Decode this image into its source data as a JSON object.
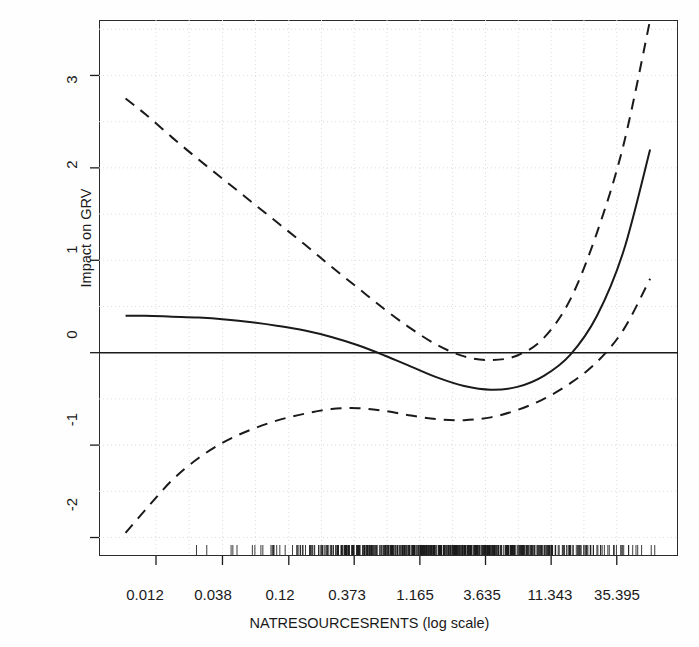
{
  "figure": {
    "kind": "statistical-plot",
    "background_color": "#ffffff",
    "ink_color": "#1a1a1a",
    "grid_color": "#d8d8d8"
  },
  "axes": {
    "x_title": "NATRESOURCESRENTS (log scale)",
    "y_title": "Impact on GRV",
    "x_tick_labels": [
      "0.012",
      "0.038",
      "0.12",
      "0.373",
      "1.165",
      "3.635",
      "11.343",
      "35.395"
    ],
    "y_tick_labels": [
      "3",
      "2",
      "1",
      "0",
      "-1",
      "-2"
    ]
  },
  "chart_data": {
    "type": "line",
    "title": "",
    "subtitle": "",
    "xlabel": "NATRESOURCESRENTS (log scale)",
    "ylabel": "Impact on GRV",
    "x_scale": "log",
    "x_tick_values": [
      0.012,
      0.038,
      0.12,
      0.373,
      1.165,
      3.635,
      11.343,
      35.395
    ],
    "x_tick_labels": [
      "0.012",
      "0.038",
      "0.12",
      "0.373",
      "1.165",
      "3.635",
      "11.343",
      "35.395"
    ],
    "y_tick_values": [
      -2,
      -1,
      0,
      1,
      2,
      3
    ],
    "y_tick_labels": [
      "-2",
      "-1",
      "0",
      "1",
      "2",
      "3"
    ],
    "xlim_log10": [
      -2.35,
      2.01
    ],
    "ylim": [
      -2.2,
      3.6
    ],
    "grid": true,
    "grid_style": "dotted",
    "legend": "none",
    "reference_line": {
      "name": "zero-line",
      "y": 0,
      "style": "solid"
    },
    "rug": {
      "present": true,
      "position": "bottom",
      "description": "dense data rug marks along x-axis"
    },
    "series": [
      {
        "name": "fitted-effect",
        "style": "solid",
        "x_log10": [
          -2.15,
          -2.0,
          -1.8,
          -1.6,
          -1.4,
          -1.2,
          -1.0,
          -0.8,
          -0.6,
          -0.4,
          -0.2,
          0.0,
          0.2,
          0.4,
          0.6,
          0.8,
          1.0,
          1.2,
          1.4,
          1.6,
          1.8
        ],
        "values": [
          0.4,
          0.4,
          0.39,
          0.38,
          0.36,
          0.33,
          0.29,
          0.24,
          0.17,
          0.08,
          -0.03,
          -0.15,
          -0.27,
          -0.36,
          -0.4,
          -0.37,
          -0.25,
          -0.02,
          0.4,
          1.1,
          2.2
        ]
      },
      {
        "name": "upper-confidence-band",
        "style": "dashed",
        "x_log10": [
          -2.15,
          -2.0,
          -1.8,
          -1.6,
          -1.4,
          -1.2,
          -1.0,
          -0.8,
          -0.6,
          -0.4,
          -0.2,
          0.0,
          0.2,
          0.4,
          0.6,
          0.8,
          1.0,
          1.2,
          1.4,
          1.6,
          1.8
        ],
        "values": [
          2.75,
          2.58,
          2.33,
          2.09,
          1.86,
          1.63,
          1.4,
          1.17,
          0.93,
          0.7,
          0.47,
          0.26,
          0.08,
          -0.04,
          -0.08,
          -0.03,
          0.16,
          0.58,
          1.3,
          2.25,
          3.6
        ]
      },
      {
        "name": "lower-confidence-band",
        "style": "dashed",
        "x_log10": [
          -2.15,
          -2.0,
          -1.8,
          -1.6,
          -1.4,
          -1.2,
          -1.0,
          -0.8,
          -0.6,
          -0.4,
          -0.2,
          0.0,
          0.2,
          0.4,
          0.6,
          0.8,
          1.0,
          1.2,
          1.4,
          1.6,
          1.8
        ],
        "values": [
          -1.95,
          -1.7,
          -1.38,
          -1.14,
          -0.96,
          -0.83,
          -0.73,
          -0.66,
          -0.61,
          -0.6,
          -0.63,
          -0.68,
          -0.72,
          -0.73,
          -0.7,
          -0.62,
          -0.5,
          -0.33,
          -0.1,
          0.25,
          0.8
        ]
      }
    ]
  }
}
